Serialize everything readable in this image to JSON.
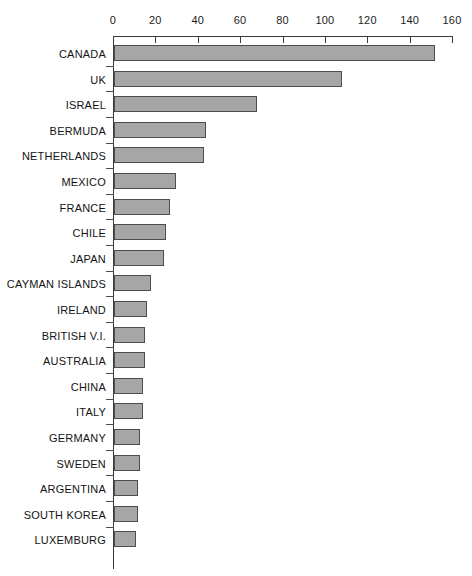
{
  "chart_data": {
    "type": "bar",
    "orientation": "horizontal",
    "title": "",
    "subtitle": "",
    "xlabel": "",
    "ylabel": "",
    "xlim": [
      0,
      160
    ],
    "xticks": [
      0,
      20,
      40,
      60,
      80,
      100,
      120,
      140,
      160
    ],
    "xtick_labels": [
      "0",
      "20",
      "40",
      "60",
      "80",
      "100",
      "120",
      "140",
      "160"
    ],
    "grid": false,
    "legend": null,
    "categories": [
      "CANADA",
      "UK",
      "ISRAEL",
      "BERMUDA",
      "NETHERLANDS",
      "MEXICO",
      "FRANCE",
      "CHILE",
      "JAPAN",
      "CAYMAN ISLANDS",
      "IRELAND",
      "BRITISH V.I.",
      "AUSTRALIA",
      "CHINA",
      "ITALY",
      "GERMANY",
      "SWEDEN",
      "ARGENTINA",
      "SOUTH KOREA",
      "LUXEMBURG"
    ],
    "values": [
      151,
      107,
      67,
      43,
      42,
      29,
      26,
      24,
      23,
      17,
      15,
      14,
      14,
      13,
      13,
      12,
      12,
      11,
      11,
      10
    ],
    "bar_color": "#a6a6a6",
    "bar_border_color": "#4d4d4d",
    "axis_color": "#3a3a3a",
    "background_color": "#ffffff"
  }
}
